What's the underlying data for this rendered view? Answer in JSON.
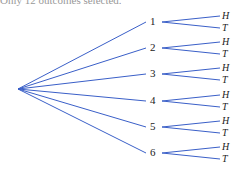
{
  "top_text": "Only 12 outcomes selected.",
  "tree": {
    "root": {
      "x": 18,
      "y": 89
    },
    "line_color": "#3a5fc8",
    "nodes": [
      {
        "label": "1",
        "x": 153,
        "y": 22,
        "branches": [
          "H",
          "T"
        ]
      },
      {
        "label": "2",
        "x": 153,
        "y": 48,
        "branches": [
          "H",
          "T"
        ]
      },
      {
        "label": "3",
        "x": 153,
        "y": 74,
        "branches": [
          "H",
          "T"
        ]
      },
      {
        "label": "4",
        "x": 153,
        "y": 101,
        "branches": [
          "H",
          "T"
        ]
      },
      {
        "label": "5",
        "x": 153,
        "y": 127,
        "branches": [
          "H",
          "T"
        ]
      },
      {
        "label": "6",
        "x": 153,
        "y": 153,
        "branches": [
          "H",
          "T"
        ]
      }
    ]
  }
}
